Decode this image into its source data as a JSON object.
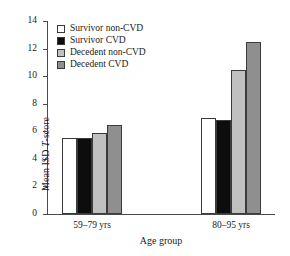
{
  "chart_data": {
    "type": "bar",
    "title": "",
    "xlabel": "Age group",
    "ylabel": "Mean ISD T-score",
    "ylabel_prefix": "Mean ISD ",
    "ylabel_italic": "T",
    "ylabel_suffix": "-score",
    "categories": [
      "59–79 yrs",
      "80–95 yrs"
    ],
    "ylim": [
      0,
      14
    ],
    "ytick_step": 2,
    "yticks": [
      "14",
      "12",
      "10",
      "8",
      "6",
      "4",
      "2",
      "0"
    ],
    "grid": false,
    "legend_position": "top-left-inside",
    "series": [
      {
        "name": "Survivor non-CVD",
        "color": "#ffffff",
        "values": [
          5.5,
          7.0
        ]
      },
      {
        "name": "Survivor CVD",
        "color": "#0d0d0d",
        "values": [
          5.5,
          6.8
        ]
      },
      {
        "name": "Decedent non-CVD",
        "color": "#c0c0c0",
        "values": [
          5.9,
          10.45
        ]
      },
      {
        "name": "Decedent CVD",
        "color": "#8f8f8f",
        "values": [
          6.45,
          12.45
        ]
      }
    ]
  }
}
